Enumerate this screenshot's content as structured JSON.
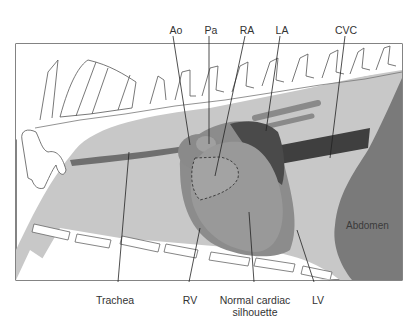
{
  "figure": {
    "colors": {
      "background": "#ffffff",
      "thorax": "#c8c8c8",
      "bone_fill": "#ffffff",
      "bone_outline": "#555555",
      "trachea": "#6f6f6f",
      "heart_outer": "#8c8c8c",
      "heart_mid": "#999999",
      "right_atrium": "#a3a3a3",
      "left_atrium": "#4a4a4a",
      "cvc": "#3f3f3f",
      "pulmonary_vessels": "#8a8a8a",
      "abdomen": "#7a7a7a",
      "frame": "#333333",
      "leader_line": "#222222"
    }
  },
  "labels": {
    "top": [
      {
        "id": "ao",
        "text": "Ao"
      },
      {
        "id": "pa",
        "text": "Pa"
      },
      {
        "id": "ra",
        "text": "RA"
      },
      {
        "id": "la",
        "text": "LA"
      },
      {
        "id": "cvc",
        "text": "CVC"
      }
    ],
    "bottom": [
      {
        "id": "trachea",
        "text": "Trachea"
      },
      {
        "id": "rv",
        "text": "RV"
      },
      {
        "id": "silhouette",
        "text": "Normal cardiac\nsilhouette",
        "line1": "Normal cardiac",
        "line2": "silhouette"
      },
      {
        "id": "lv",
        "text": "LV"
      }
    ],
    "inner": [
      {
        "id": "abdomen",
        "text": "Abdomen"
      }
    ]
  }
}
